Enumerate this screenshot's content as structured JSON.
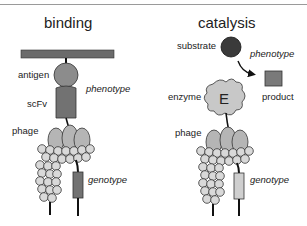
{
  "panels": {
    "binding": {
      "title": "binding",
      "labels": {
        "antigen": "antigen",
        "scfv": "scFv",
        "phenotype": "phenotype",
        "phage": "phage",
        "genotype": "genotype"
      }
    },
    "catalysis": {
      "title": "catalysis",
      "labels": {
        "substrate": "substrate",
        "phenotype": "phenotype",
        "enzyme": "enzyme",
        "enzyme_letter": "E",
        "product": "product",
        "phage": "phage",
        "genotype": "genotype"
      }
    }
  },
  "colors": {
    "dark_gray": "#6b6b6b",
    "mid_gray": "#8c8c8c",
    "light_gray": "#c8c8c8",
    "substrate": "#3a3a3a",
    "product": "#7a7a7a",
    "genotype_binding": "#727272",
    "genotype_catalysis": "#cfcfcf",
    "outline": "#222222"
  }
}
